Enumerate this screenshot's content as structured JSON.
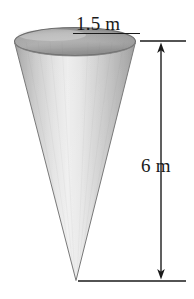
{
  "figure": {
    "type": "geometry-diagram",
    "shape": "cone",
    "orientation": "apex-down",
    "background_color": "#ffffff"
  },
  "labels": {
    "diameter": "1.5 m",
    "height": "6 m"
  },
  "dimensions": {
    "diameter_value": 1.5,
    "diameter_unit": "m",
    "height_value": 6,
    "height_unit": "m"
  },
  "colors": {
    "outline": "#5a5a5a",
    "text": "#1a1a1a",
    "dimension_line": "#1a1a1a",
    "cone_light": "#f2f2f2",
    "cone_mid": "#cfcfcf",
    "cone_dark": "#a8a8a8",
    "ellipse_top": "#b8b8b8",
    "ellipse_top_shadow": "#909090"
  },
  "annotations": {
    "diameter_underline": "horizontal rule beneath 1.5 m label",
    "height_arrow_top": "up arrowhead",
    "height_arrow_bottom": "down arrowhead",
    "top_extension_line": "horizontal extension line at cone rim level",
    "bottom_extension_line": "horizontal extension line at cone apex level"
  }
}
